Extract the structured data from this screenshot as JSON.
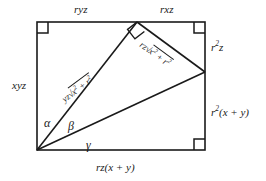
{
  "figure": {
    "stroke_color": "#1a1a1a",
    "background_color": "#ffffff",
    "rect": {
      "left": 37,
      "top": 22,
      "right": 205,
      "bottom": 150
    },
    "apex": {
      "x": 137,
      "y": 22
    },
    "right_vertex": {
      "x": 205,
      "y": 72
    },
    "origin": {
      "x": 37,
      "y": 150
    }
  },
  "labels": {
    "top_left": "ryz",
    "top_right": "rxz",
    "left_side": "xyz",
    "right_upper": {
      "base": "r",
      "exp": "2",
      "tail": "z"
    },
    "right_lower": {
      "base": "r",
      "exp": "2",
      "tail": "(x + y)"
    },
    "bottom": "rz(x + y)",
    "hyp_left": {
      "prefix": "yz",
      "radical": "√",
      "term1": "x",
      "exp1": "2",
      "plus": " + ",
      "term2": "r",
      "exp2": "2"
    },
    "hyp_right": {
      "prefix": "rz",
      "radical": "√",
      "term1": "x",
      "exp1": "2",
      "plus": " + ",
      "term2": "r",
      "exp2": "2"
    }
  },
  "angles": {
    "alpha": "α",
    "beta": "β",
    "gamma": "γ"
  },
  "right_angle_marks": [
    {
      "name": "top-left-corner",
      "x": 37,
      "y": 22
    },
    {
      "name": "top-right-corner",
      "x": 205,
      "y": 22
    },
    {
      "name": "bottom-right-corner",
      "x": 205,
      "y": 150
    },
    {
      "name": "apex-on-hypotenuse",
      "x": 137,
      "y": 22
    }
  ]
}
